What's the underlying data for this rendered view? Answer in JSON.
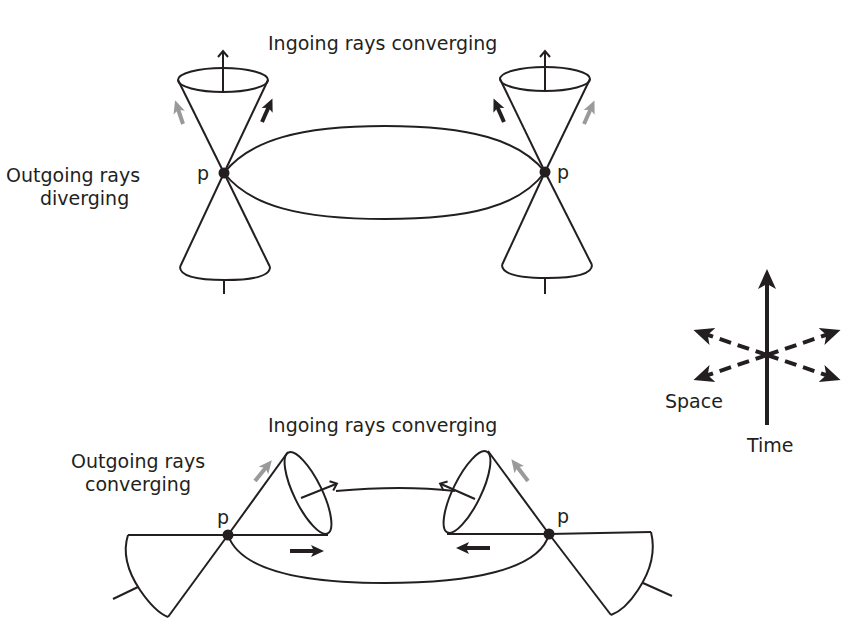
{
  "top_panel": {
    "title": "Ingoing rays converging",
    "side_label_line1": "Outgoing rays",
    "side_label_line2": "diverging",
    "left_point_label": "p",
    "right_point_label": "p"
  },
  "bottom_panel": {
    "title": "Ingoing rays converging",
    "side_label_line1": "Outgoing rays",
    "side_label_line2": "converging",
    "left_point_label": "p",
    "right_point_label": "p"
  },
  "axes_legend": {
    "space_label": "Space",
    "time_label": "Time"
  },
  "colors": {
    "ink": "#231f20",
    "outgoing_arrow_grey": "#9a9a9a",
    "background": "#ffffff"
  }
}
